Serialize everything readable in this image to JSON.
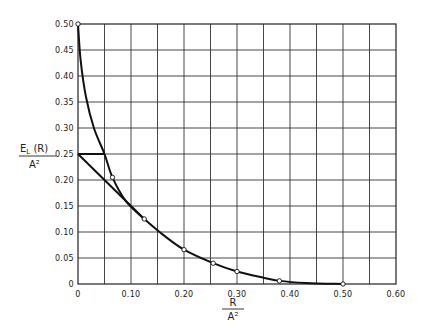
{
  "chart_data": {
    "type": "line",
    "title": "",
    "xlabel": {
      "numerator": "R",
      "denominator": "A²"
    },
    "ylabel": {
      "numerator": "E_L (R)",
      "numerator_main": "E",
      "numerator_sub": "L",
      "numerator_rest": " (R)",
      "denominator": "A²"
    },
    "xlim": [
      0,
      0.6
    ],
    "ylim": [
      0,
      0.5
    ],
    "grid": true,
    "x_grid_step": 0.05,
    "y_grid_step": 0.05,
    "x_ticks": [
      {
        "value": 0,
        "label": "0"
      },
      {
        "value": 0.1,
        "label": "0.10"
      },
      {
        "value": 0.2,
        "label": "0.20"
      },
      {
        "value": 0.3,
        "label": "0.30"
      },
      {
        "value": 0.4,
        "label": "0.40"
      },
      {
        "value": 0.5,
        "label": "0.50"
      },
      {
        "value": 0.6,
        "label": "0.60"
      }
    ],
    "y_ticks": [
      {
        "value": 0,
        "label": "0"
      },
      {
        "value": 0.05,
        "label": "0.05"
      },
      {
        "value": 0.1,
        "label": "0.10"
      },
      {
        "value": 0.15,
        "label": "0.15"
      },
      {
        "value": 0.2,
        "label": "0.20"
      },
      {
        "value": 0.25,
        "label": "0.25"
      },
      {
        "value": 0.3,
        "label": "0.30"
      },
      {
        "value": 0.35,
        "label": "0.35"
      },
      {
        "value": 0.4,
        "label": "0.40"
      },
      {
        "value": 0.45,
        "label": "0.45"
      },
      {
        "value": 0.5,
        "label": "0.50"
      }
    ],
    "series": [
      {
        "name": "upper-curve",
        "x": [
          0,
          0.005,
          0.015,
          0.03,
          0.05,
          0.065,
          0.09,
          0.125
        ],
        "y": [
          0.5,
          0.43,
          0.36,
          0.3,
          0.25,
          0.205,
          0.16,
          0.125
        ]
      },
      {
        "name": "horizontal-segment",
        "x": [
          0,
          0.05
        ],
        "y": [
          0.25,
          0.25
        ]
      },
      {
        "name": "straight-line",
        "x": [
          0,
          0.125
        ],
        "y": [
          0.25,
          0.125
        ]
      },
      {
        "name": "lower-curve",
        "x": [
          0.125,
          0.16,
          0.2,
          0.255,
          0.3,
          0.35,
          0.38,
          0.43,
          0.5
        ],
        "y": [
          0.125,
          0.095,
          0.066,
          0.04,
          0.024,
          0.012,
          0.006,
          0.002,
          0.0
        ]
      }
    ],
    "markers": [
      {
        "x": 0,
        "y": 0.5
      },
      {
        "x": 0.065,
        "y": 0.205
      },
      {
        "x": 0.125,
        "y": 0.125
      },
      {
        "x": 0.2,
        "y": 0.066
      },
      {
        "x": 0.255,
        "y": 0.04
      },
      {
        "x": 0.3,
        "y": 0.024
      },
      {
        "x": 0.38,
        "y": 0.006
      },
      {
        "x": 0.5,
        "y": 0.0
      }
    ]
  }
}
